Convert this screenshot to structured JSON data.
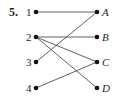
{
  "problem_number": "5.",
  "left_nodes": [
    {
      "id": "1",
      "label": "1",
      "x": 36,
      "y": 12
    },
    {
      "id": "2",
      "label": "2",
      "x": 36,
      "y": 37
    },
    {
      "id": "3",
      "label": "3",
      "x": 36,
      "y": 62
    },
    {
      "id": "4",
      "label": "4",
      "x": 36,
      "y": 88
    }
  ],
  "right_nodes": [
    {
      "id": "A",
      "label": "A",
      "x": 97,
      "y": 12
    },
    {
      "id": "B",
      "label": "B",
      "x": 97,
      "y": 37
    },
    {
      "id": "C",
      "label": "C",
      "x": 97,
      "y": 62
    },
    {
      "id": "D",
      "label": "D",
      "x": 97,
      "y": 88
    }
  ],
  "edges": [
    {
      "from": "1",
      "to": "A"
    },
    {
      "from": "2",
      "to": "B"
    },
    {
      "from": "2",
      "to": "C"
    },
    {
      "from": "2",
      "to": "D"
    },
    {
      "from": "3",
      "to": "A"
    },
    {
      "from": "4",
      "to": "C"
    }
  ],
  "colors": {
    "ink": "#231f20",
    "line": "#3a3a3a",
    "background": "#ffffff"
  }
}
